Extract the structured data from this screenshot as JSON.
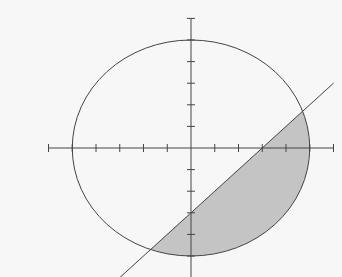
{
  "diagram": {
    "type": "coordinate-plane-region",
    "axes": {
      "x_range": [
        -6,
        6
      ],
      "y_range": [
        -6,
        6
      ],
      "tick_step": 1,
      "labels_shown": false
    },
    "circle": {
      "center": [
        0,
        0
      ],
      "radius": 5
    },
    "line": {
      "slope": 1,
      "intercept": -3,
      "from": [
        -3,
        -6
      ],
      "to": [
        6,
        3
      ]
    },
    "intersections": [
      [
        4.7,
        1.7
      ],
      [
        -1.7,
        -4.7
      ]
    ],
    "shaded_region": "inside circle, below line",
    "colors": {
      "background": "#f7f7f7",
      "stroke": "#444444",
      "fill": "#c4c4c4"
    }
  }
}
